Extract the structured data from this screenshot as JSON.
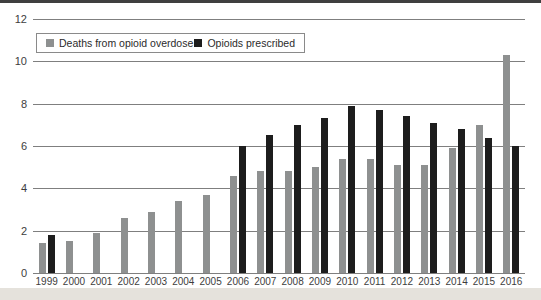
{
  "page": {
    "top_bar_color": "#3f3f3f",
    "background": "#ffffff",
    "footer_strip_color": "#e5e2dc"
  },
  "chart_data": {
    "type": "bar",
    "title": "",
    "categories": [
      "1999",
      "2000",
      "2001",
      "2002",
      "2003",
      "2004",
      "2005",
      "2006",
      "2007",
      "2008",
      "2009",
      "2010",
      "2011",
      "2012",
      "2013",
      "2014",
      "2015",
      "2016"
    ],
    "series": [
      {
        "name": "Deaths from opioid overdose",
        "color": "#8e9090",
        "values": [
          1.4,
          1.5,
          1.9,
          2.6,
          2.9,
          3.4,
          3.7,
          4.6,
          4.8,
          4.8,
          5.0,
          5.4,
          5.4,
          5.1,
          5.1,
          5.9,
          7.0,
          10.3
        ]
      },
      {
        "name": "Opioids prescribed",
        "color": "#1d1d1d",
        "values": [
          1.8,
          null,
          null,
          null,
          null,
          null,
          null,
          6.0,
          6.5,
          7.0,
          7.3,
          7.9,
          7.7,
          7.4,
          7.1,
          6.8,
          6.4,
          6.0
        ]
      }
    ],
    "y_ticks": [
      12,
      10,
      8,
      6,
      4,
      2,
      0
    ],
    "ylim": [
      0,
      12
    ],
    "grid": true,
    "gridline_color": "#7f7f7f",
    "legend_position": "top-left"
  }
}
